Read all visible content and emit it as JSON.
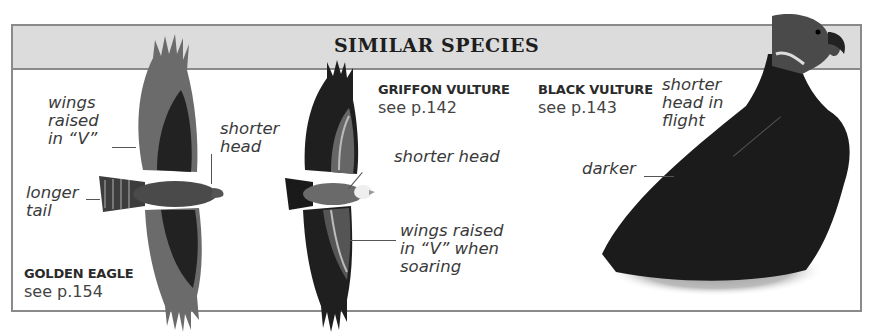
{
  "panel": {
    "title": "SIMILAR SPECIES",
    "colors": {
      "header_band": "#dcdcdc",
      "frame_border": "#8a8a8a",
      "background": "#ffffff"
    }
  },
  "species": [
    {
      "name": "GOLDEN EAGLE",
      "reference": "see p.154",
      "image": "golden-eagle-flight-illustration",
      "annotations": [
        {
          "text": "wings\nraised\nin “V”"
        },
        {
          "text": "shorter\nhead"
        },
        {
          "text": "longer\ntail"
        }
      ]
    },
    {
      "name": "GRIFFON VULTURE",
      "reference": "see p.142",
      "image": "griffon-vulture-flight-illustration",
      "annotations": [
        {
          "text": "shorter head"
        },
        {
          "text": "wings raised\nin “V” when\nsoaring"
        }
      ]
    },
    {
      "name": "BLACK VULTURE",
      "reference": "see p.143",
      "image": "black-vulture-perched-photo",
      "annotations": [
        {
          "text": "shorter\nhead in\nflight"
        },
        {
          "text": "darker"
        }
      ]
    }
  ]
}
